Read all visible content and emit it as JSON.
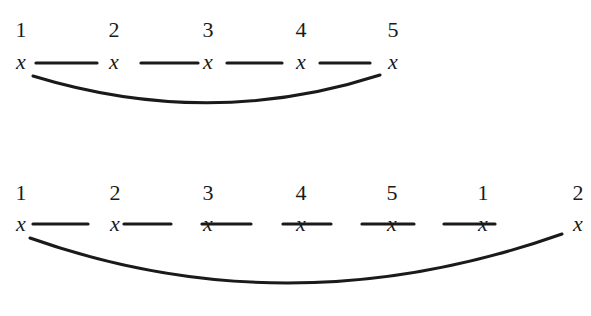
{
  "diagram": {
    "rows": [
      {
        "id": "top-chain",
        "number_y": 37,
        "node_y": 69,
        "nodes": [
          {
            "index": "1",
            "symbol": "x",
            "x": 21
          },
          {
            "index": "2",
            "symbol": "x",
            "x": 114
          },
          {
            "index": "3",
            "symbol": "x",
            "x": 208
          },
          {
            "index": "4",
            "symbol": "x",
            "x": 301
          },
          {
            "index": "5",
            "symbol": "x",
            "x": 393
          }
        ],
        "edges": [
          {
            "from": 0,
            "to": 1,
            "x1": 36,
            "x2": 97,
            "y": 63
          },
          {
            "from": 1,
            "to": 2,
            "x1": 141,
            "x2": 198,
            "y": 63
          },
          {
            "from": 2,
            "to": 3,
            "x1": 227,
            "x2": 282,
            "y": 63
          },
          {
            "from": 3,
            "to": 4,
            "x1": 320,
            "x2": 370,
            "y": 63
          }
        ],
        "arc": {
          "from": 0,
          "to": 4,
          "path": "M 33 76 Q 210 130 380 75"
        }
      },
      {
        "id": "bottom-chain",
        "number_y": 200,
        "node_y": 231,
        "nodes": [
          {
            "index": "1",
            "symbol": "x",
            "x": 21
          },
          {
            "index": "2",
            "symbol": "x",
            "x": 115
          },
          {
            "index": "3",
            "symbol": "x",
            "x": 208
          },
          {
            "index": "4",
            "symbol": "x",
            "x": 301
          },
          {
            "index": "5",
            "symbol": "x",
            "x": 392
          },
          {
            "index": "1",
            "symbol": "x",
            "x": 483
          },
          {
            "index": "2",
            "symbol": "x",
            "x": 578
          }
        ],
        "edges": [
          {
            "from": 0,
            "to": 1,
            "x1": 33,
            "x2": 88,
            "y": 224
          },
          {
            "from": 1,
            "to": 2,
            "x1": 124,
            "x2": 171,
            "y": 224
          },
          {
            "from": 2,
            "to": 3,
            "x1": 202,
            "x2": 251,
            "y": 224
          },
          {
            "from": 3,
            "to": 4,
            "x1": 283,
            "x2": 331,
            "y": 224
          },
          {
            "from": 4,
            "to": 5,
            "x1": 362,
            "x2": 414,
            "y": 224
          },
          {
            "from": 5,
            "to": 6,
            "x1": 444,
            "x2": 495,
            "y": 224
          }
        ],
        "arc": {
          "from": 0,
          "to": 6,
          "path": "M 30 238 Q 290 330 562 234"
        }
      }
    ]
  }
}
